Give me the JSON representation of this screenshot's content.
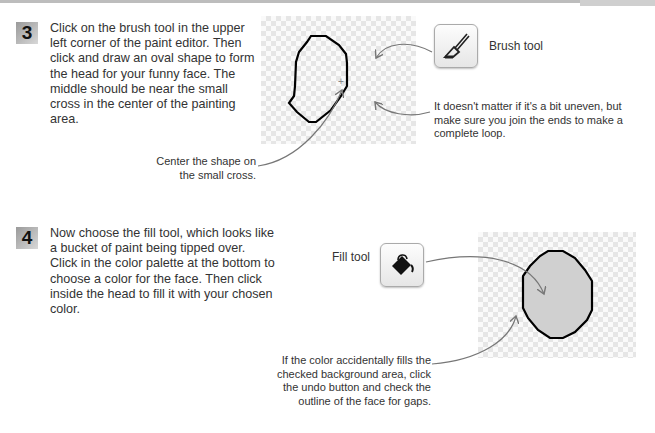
{
  "steps": [
    {
      "number": "3",
      "text": "Click on the brush tool in the upper left corner of the paint editor. Then click and draw an oval shape to form the head for your funny face. The middle should be near the small cross in the center of the painting area.",
      "tool": {
        "label": "Brush tool",
        "icon": "brush-icon"
      },
      "captions": {
        "uneven": "It doesn't matter if it's a bit uneven, but make sure you join the ends to make a complete loop.",
        "center": "Center the shape on the small cross."
      }
    },
    {
      "number": "4",
      "text": "Now choose the fill tool, which looks like a bucket of paint being tipped over. Click in the color palette at the bottom to choose a color for the face. Then click inside the head to fill it with your chosen color.",
      "tool": {
        "label": "Fill tool",
        "icon": "paint-bucket-icon"
      },
      "captions": {
        "undo": "If the color accidentally fills the checked background area, click the undo button and check the outline of the face for gaps."
      }
    }
  ],
  "colors": {
    "badge": "#b5b5b5",
    "outline": "#000000",
    "fill": "#cfcfcf",
    "arrow": "#777777"
  }
}
